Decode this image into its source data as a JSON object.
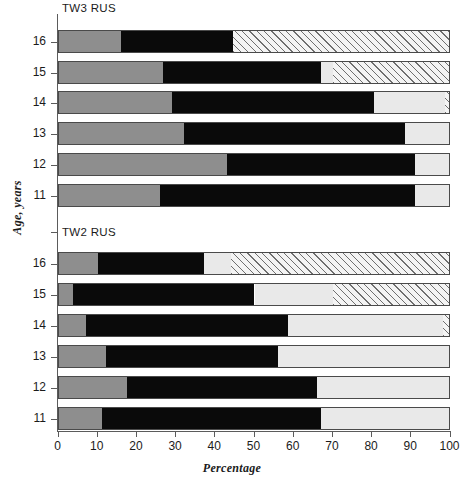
{
  "chart_data": {
    "type": "bar",
    "subtype": "stacked-horizontal-100percent",
    "title": "",
    "xlabel": "Percentage",
    "ylabel": "Age, years",
    "xlim": [
      0,
      100
    ],
    "xticks": [
      0,
      10,
      20,
      30,
      40,
      50,
      60,
      70,
      80,
      90,
      100
    ],
    "grid": false,
    "legend": "none",
    "series": [
      {
        "name": "segment-1",
        "style": "mid-gray",
        "color": "#8e8e8e"
      },
      {
        "name": "segment-2",
        "style": "black",
        "color": "#0a0a0a"
      },
      {
        "name": "segment-3",
        "style": "light-gray",
        "color": "#e9e9e9"
      },
      {
        "name": "segment-4",
        "style": "hatched",
        "color": "#f4f4f4"
      }
    ],
    "panels": [
      {
        "label": "TW3 RUS",
        "categories": [
          "16",
          "15",
          "14",
          "13",
          "12",
          "11"
        ],
        "rows": [
          {
            "category": "16",
            "values": [
              16.0,
              28.6,
              0.0,
              55.4
            ]
          },
          {
            "category": "15",
            "values": [
              26.7,
              40.3,
              3.0,
              30.0
            ]
          },
          {
            "category": "14",
            "values": [
              29.0,
              51.5,
              18.0,
              1.5
            ]
          },
          {
            "category": "13",
            "values": [
              32.0,
              56.5,
              11.5,
              0.0
            ]
          },
          {
            "category": "12",
            "values": [
              43.0,
              48.0,
              9.0,
              0.0
            ]
          },
          {
            "category": "11",
            "values": [
              26.0,
              65.0,
              9.0,
              0.0
            ]
          }
        ]
      },
      {
        "label": "TW2 RUS",
        "categories": [
          "16",
          "15",
          "14",
          "13",
          "12",
          "11"
        ],
        "rows": [
          {
            "category": "16",
            "values": [
              10.0,
              27.0,
              7.0,
              56.0
            ]
          },
          {
            "category": "15",
            "values": [
              3.7,
              46.3,
              20.0,
              30.0
            ]
          },
          {
            "category": "14",
            "values": [
              7.0,
              51.5,
              39.5,
              2.0
            ]
          },
          {
            "category": "13",
            "values": [
              12.0,
              44.0,
              44.0,
              0.0
            ]
          },
          {
            "category": "12",
            "values": [
              17.5,
              48.5,
              34.0,
              0.0
            ]
          },
          {
            "category": "11",
            "values": [
              11.0,
              56.0,
              33.0,
              0.0
            ]
          }
        ]
      }
    ]
  },
  "axis": {
    "x_title": "Percentage",
    "y_title": "Age, years",
    "x_tick_labels": [
      "0",
      "10",
      "20",
      "30",
      "40",
      "50",
      "60",
      "70",
      "80",
      "90",
      "100"
    ],
    "y_tick_labels_panel1": [
      "16",
      "15",
      "14",
      "13",
      "12",
      "11"
    ],
    "y_tick_labels_panel2": [
      "16",
      "15",
      "14",
      "13",
      "12",
      "11"
    ]
  },
  "panel_titles": {
    "top": "TW3 RUS",
    "bottom": "TW2 RUS"
  },
  "colors": {
    "segment_1": "#8e8e8e",
    "segment_2": "#0a0a0a",
    "segment_3": "#e9e9e9",
    "segment_4_hatch": "#6f6f6f",
    "axis": "#5b5b5b",
    "text": "#1b1b1b",
    "background": "#ffffff"
  }
}
